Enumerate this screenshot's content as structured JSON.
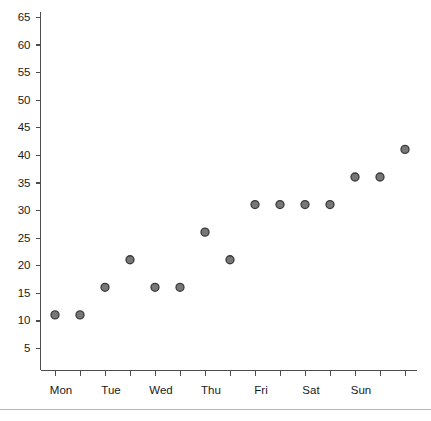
{
  "chart_data": {
    "type": "scatter",
    "title": "",
    "subtitle": "",
    "xlabel": "",
    "ylabel": "",
    "grid": false,
    "legend": "none",
    "marker": {
      "shape": "circle",
      "fill_color": "#777777",
      "edge_color": "#3a3a3a",
      "radius_px": 4
    },
    "ylim": [
      0,
      67
    ],
    "yticks": [
      5,
      10,
      15,
      20,
      25,
      30,
      35,
      40,
      45,
      50,
      55,
      60,
      65
    ],
    "ytick_labels": [
      "5",
      "10",
      "15",
      "20",
      "25",
      "30",
      "35",
      "40",
      "45",
      "50",
      "55",
      "60",
      "65"
    ],
    "xtick_count": 15,
    "xtick_labels": [
      "Mon",
      "",
      "Tue",
      "",
      "Wed",
      "",
      "Thu",
      "",
      "Fri",
      "",
      "Sat",
      "",
      "Sun",
      "",
      ""
    ],
    "x_categories": [
      "Mon",
      "Tue",
      "Wed",
      "Thu",
      "Fri",
      "Sat",
      "Sun"
    ],
    "x": [
      0,
      1,
      2,
      3,
      4,
      5,
      6,
      7,
      8,
      9,
      10,
      11,
      12,
      13,
      14
    ],
    "values": [
      11,
      11,
      16,
      21,
      16,
      16,
      26,
      21,
      31,
      31,
      31,
      31,
      36,
      36,
      41
    ],
    "points": [
      {
        "x": 0,
        "y": 11
      },
      {
        "x": 1,
        "y": 11
      },
      {
        "x": 2,
        "y": 16
      },
      {
        "x": 3,
        "y": 21
      },
      {
        "x": 4,
        "y": 16
      },
      {
        "x": 5,
        "y": 16
      },
      {
        "x": 6,
        "y": 26
      },
      {
        "x": 7,
        "y": 21
      },
      {
        "x": 8,
        "y": 31
      },
      {
        "x": 9,
        "y": 31
      },
      {
        "x": 10,
        "y": 31
      },
      {
        "x": 11,
        "y": 31
      },
      {
        "x": 12,
        "y": 36
      },
      {
        "x": 13,
        "y": 36
      },
      {
        "x": 14,
        "y": 41
      }
    ],
    "axis_color": "#4d4d4d",
    "text_color": "#1a1a1a",
    "background_color": "#ffffff"
  }
}
